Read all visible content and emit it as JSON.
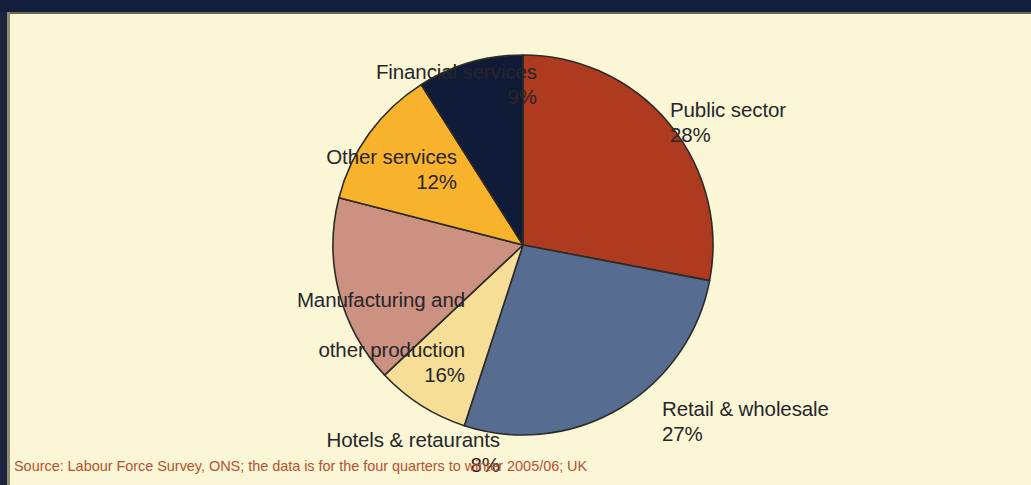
{
  "figure": {
    "background_color": "#fbf7d6",
    "top_bar_color": "#131d3c",
    "source_note": "Source: Labour Force Survey, ONS; the data is for the four quarters to winter 2005/06; UK",
    "source_note_color": "#b8512f"
  },
  "chart_data": {
    "type": "pie",
    "title": "",
    "subtitle": "",
    "xlabel": "",
    "ylabel": "",
    "legend_position": "none",
    "grid": false,
    "value_unit": "%",
    "start_angle_deg": 0,
    "direction": "clockwise",
    "categories": [
      "Public sector",
      "Retail & wholesale",
      "Hotels & retaurants",
      "Manufacturing and other production",
      "Other services",
      "Financial services"
    ],
    "values": [
      28,
      27,
      8,
      16,
      12,
      9
    ],
    "colors": [
      "#ae3a20",
      "#566c90",
      "#f7de96",
      "#cc9181",
      "#f9b22b",
      "#101b38"
    ],
    "slices": [
      {
        "label": "Public sector",
        "label_line1": "Public sector",
        "value": 28,
        "value_text": "28%",
        "color": "#ae3a20"
      },
      {
        "label": "Retail & wholesale",
        "label_line1": "Retail & wholesale",
        "value": 27,
        "value_text": "27%",
        "color": "#566c90"
      },
      {
        "label": "Hotels & retaurants",
        "label_line1": "Hotels & retaurants",
        "value": 8,
        "value_text": "8%",
        "color": "#f7de96"
      },
      {
        "label": "Manufacturing and other production",
        "label_line1": "Manufacturing and",
        "label_line2": "other production",
        "value": 16,
        "value_text": "16%",
        "color": "#cc9181"
      },
      {
        "label": "Other services",
        "label_line1": "Other services",
        "value": 12,
        "value_text": "12%",
        "color": "#f9b22b"
      },
      {
        "label": "Financial services",
        "label_line1": "Financial services",
        "value": 9,
        "value_text": "9%",
        "color": "#101b38"
      }
    ]
  }
}
